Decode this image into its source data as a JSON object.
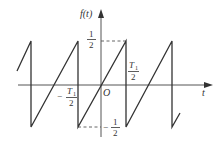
{
  "diagram": {
    "type": "sawtooth-waveform",
    "y_axis_label": "f(t)",
    "x_axis_label": "t",
    "origin_label": "O",
    "labels": {
      "half_pos": {
        "num": "1",
        "den": "2"
      },
      "half_neg": {
        "sign": "−",
        "num": "1",
        "den": "2"
      },
      "t1_half_pos": {
        "num": "T",
        "sub": "1",
        "den": "2"
      },
      "t1_half_neg": {
        "sign": "−",
        "num": "T",
        "sub": "1",
        "den": "2"
      }
    },
    "waveform": {
      "amplitude_max": "1/2",
      "amplitude_min": "-1/2",
      "period": "T1",
      "discontinuities_at": [
        "-3T1/2",
        "-T1/2",
        "T1/2",
        "3T1/2"
      ]
    },
    "colors": {
      "line": "#333333",
      "axis": "#555555",
      "background": "#ffffff"
    }
  }
}
